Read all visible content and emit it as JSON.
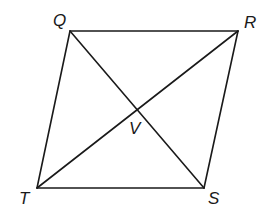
{
  "figure": {
    "type": "parallelogram with diagonals",
    "stroke_color": "#1a1a1a",
    "vertices": {
      "Q": {
        "label": "Q",
        "x": 70,
        "y": 31
      },
      "R": {
        "label": "R",
        "x": 238,
        "y": 31
      },
      "S": {
        "label": "S",
        "x": 204,
        "y": 188
      },
      "T": {
        "label": "T",
        "x": 37,
        "y": 188
      }
    },
    "intersection": {
      "label": "V",
      "x": 137,
      "y": 109
    },
    "sides": [
      "QR",
      "RS",
      "ST",
      "TQ"
    ],
    "diagonals": [
      "QS",
      "RT"
    ]
  }
}
